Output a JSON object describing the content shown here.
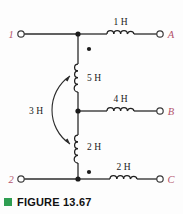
{
  "figure": {
    "caption_marker": "green-square",
    "caption": "FIGURE 13.67",
    "caption_color": "#2f9e52"
  },
  "circuit": {
    "type": "coupled-inductor-network",
    "terminals": [
      {
        "id": "terminal-1",
        "label": "1",
        "side": "left",
        "row": "top"
      },
      {
        "id": "terminal-2",
        "label": "2",
        "side": "left",
        "row": "bottom"
      },
      {
        "id": "terminal-a",
        "label": "A",
        "side": "right",
        "row": "top"
      },
      {
        "id": "terminal-b",
        "label": "B",
        "side": "right",
        "row": "middle"
      },
      {
        "id": "terminal-c",
        "label": "C",
        "side": "right",
        "row": "bottom"
      }
    ],
    "inductors": [
      {
        "id": "inductor-1h",
        "label": "1 H",
        "value": 1,
        "unit": "H",
        "orientation": "horizontal",
        "branch": "top-right-to-A"
      },
      {
        "id": "inductor-4h",
        "label": "4 H",
        "value": 4,
        "unit": "H",
        "orientation": "horizontal",
        "branch": "middle-right-to-B"
      },
      {
        "id": "inductor-2h-bottom",
        "label": "2 H",
        "value": 2,
        "unit": "H",
        "orientation": "horizontal",
        "branch": "bottom-right-to-C"
      },
      {
        "id": "inductor-5h",
        "label": "5 H",
        "value": 5,
        "unit": "H",
        "orientation": "vertical",
        "branch": "top-node-to-middle-node"
      },
      {
        "id": "inductor-2h-vertical",
        "label": "2 H",
        "value": 2,
        "unit": "H",
        "orientation": "vertical",
        "branch": "middle-node-to-bottom-node"
      }
    ],
    "mutual_coupling": {
      "id": "mutual-3h",
      "label": "3 H",
      "value": 3,
      "unit": "H",
      "between": [
        "inductor-5h",
        "inductor-2h-vertical"
      ],
      "arrow": "double-headed-curved"
    },
    "polarity_dots": [
      {
        "id": "dot-5h",
        "for": "inductor-5h",
        "position": "above"
      },
      {
        "id": "dot-2h-vertical",
        "for": "inductor-2h-vertical",
        "position": "below"
      }
    ],
    "nodes": [
      {
        "id": "node-top",
        "connects": [
          "terminal-1",
          "inductor-1h",
          "inductor-5h"
        ]
      },
      {
        "id": "node-middle",
        "connects": [
          "inductor-5h",
          "inductor-4h",
          "inductor-2h-vertical"
        ]
      },
      {
        "id": "node-bottom",
        "connects": [
          "terminal-2",
          "inductor-2h-vertical",
          "inductor-2h-bottom"
        ]
      }
    ]
  }
}
